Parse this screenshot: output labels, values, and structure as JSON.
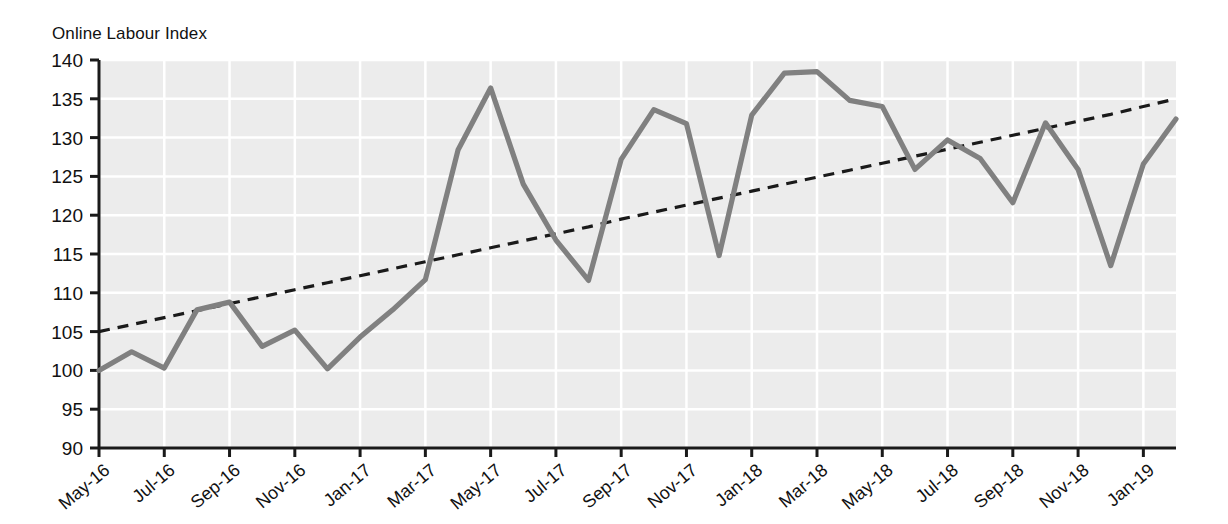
{
  "chart_data": {
    "type": "line",
    "title": "Online Labour Index",
    "xlabel": "",
    "ylabel": "Online Labour Index",
    "ylim": [
      90,
      140
    ],
    "ytick_step": 5,
    "yticks": [
      90,
      95,
      100,
      105,
      110,
      115,
      120,
      125,
      130,
      135,
      140
    ],
    "grid": true,
    "grid_color": "#ffffff",
    "plot_background": "#ececec",
    "legend": null,
    "x": [
      "May-16",
      "Jun-16",
      "Jul-16",
      "Aug-16",
      "Sep-16",
      "Oct-16",
      "Nov-16",
      "Dec-16",
      "Jan-17",
      "Feb-17",
      "Mar-17",
      "Apr-17",
      "May-17",
      "Jun-17",
      "Jul-17",
      "Aug-17",
      "Sep-17",
      "Oct-17",
      "Nov-17",
      "Dec-17",
      "Jan-18",
      "Feb-18",
      "Mar-18",
      "Apr-18",
      "May-18",
      "Jun-18",
      "Jul-18",
      "Aug-18",
      "Sep-18",
      "Oct-18",
      "Nov-18",
      "Dec-18",
      "Jan-19",
      "Feb-19"
    ],
    "xtick_labels": [
      "May-16",
      "Jul-16",
      "Sep-16",
      "Nov-16",
      "Jan-17",
      "Mar-17",
      "May-17",
      "Jul-17",
      "Sep-17",
      "Nov-17",
      "Jan-18",
      "Mar-18",
      "May-18",
      "Jul-18",
      "Sep-18",
      "Nov-18",
      "Jan-19"
    ],
    "series": [
      {
        "name": "Online Labour Index",
        "style": "solid",
        "color": "#808080",
        "values": [
          100.0,
          102.4,
          100.3,
          107.8,
          108.8,
          103.1,
          105.2,
          100.2,
          104.3,
          107.8,
          111.7,
          128.4,
          136.4,
          124.0,
          116.8,
          111.6,
          127.2,
          133.6,
          131.8,
          114.8,
          132.9,
          138.3,
          138.5,
          134.8,
          134.0,
          125.9,
          129.7,
          127.3,
          121.6,
          131.9,
          125.9,
          113.5,
          126.6,
          132.4
        ]
      },
      {
        "name": "Linear trend",
        "style": "dashed",
        "color": "#1a1a1a",
        "values": [
          105.0,
          105.9,
          106.8,
          107.7,
          108.6,
          109.5,
          110.4,
          111.3,
          112.2,
          113.1,
          114.0,
          114.9,
          115.8,
          116.7,
          117.6,
          118.5,
          119.5,
          120.4,
          121.3,
          122.2,
          123.1,
          124.0,
          124.9,
          125.8,
          126.7,
          127.6,
          128.5,
          129.4,
          130.3,
          131.2,
          132.1,
          133.0,
          134.0,
          135.0
        ]
      }
    ]
  }
}
